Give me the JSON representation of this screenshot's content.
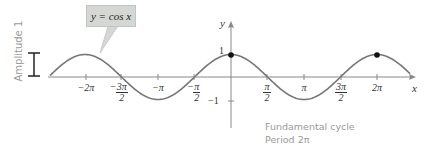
{
  "chart_data": {
    "type": "line",
    "title": "",
    "function": "y = cos x",
    "xlabel": "x",
    "ylabel": "y",
    "xlim": [
      -2.55,
      2.45
    ],
    "ylim": [
      -1.2,
      1.3
    ],
    "x_ticks": [
      "-2π",
      "-3π/2",
      "-π",
      "-π/2",
      "π/2",
      "π",
      "3π/2",
      "2π"
    ],
    "y_ticks": [
      "1",
      "-1"
    ],
    "highlighted_points": [
      {
        "x": "0",
        "y": 1
      },
      {
        "x": "2π",
        "y": 1
      }
    ],
    "fundamental_cycle": {
      "from": "0",
      "to": "2π"
    },
    "annotations": [
      "y = cos x",
      "Amplitude 1",
      "Fundamental cycle",
      "Period 2π"
    ],
    "grid": false,
    "series": [
      {
        "name": "cos x",
        "color": "#777777"
      }
    ]
  },
  "labels": {
    "callout": "y = cos x",
    "amplitude": "Amplitude 1",
    "cycle_line1": "Fundamental cycle",
    "cycle_line2": "Period 2π",
    "x_axis": "x",
    "y_axis": "y",
    "y_one": "1",
    "y_neg_one": "−1",
    "ticks": {
      "neg2pi": "−2π",
      "neg3pi2_num": "3π",
      "neg3pi2_den": "2",
      "negpi": "−π",
      "negpi2_num": "π",
      "negpi2_den": "2",
      "pi2_num": "π",
      "pi2_den": "2",
      "pi": "π",
      "threepi2_num": "3π",
      "threepi2_den": "2",
      "twopi": "2π"
    }
  }
}
